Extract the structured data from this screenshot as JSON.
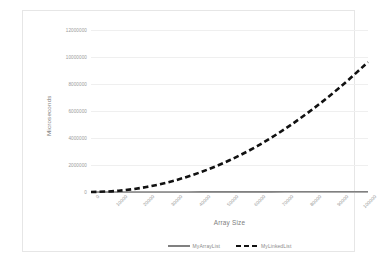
{
  "chart_data": {
    "type": "line",
    "title": "",
    "xlabel": "Array Size",
    "ylabel": "Microseconds",
    "xlim": [
      0,
      100000
    ],
    "ylim": [
      0,
      12000000
    ],
    "grid": true,
    "legend_position": "bottom",
    "categories": [
      0,
      10000,
      20000,
      30000,
      40000,
      50000,
      60000,
      70000,
      80000,
      90000,
      100000
    ],
    "xtick_labels": [
      "0",
      "10000",
      "20000",
      "30000",
      "40000",
      "50000",
      "60000",
      "70000",
      "80000",
      "90000",
      "100000"
    ],
    "ytick_labels": [
      "0",
      "2000000",
      "4000000",
      "6000000",
      "8000000",
      "10000000",
      "12000000"
    ],
    "ytick_values": [
      0,
      2000000,
      4000000,
      6000000,
      8000000,
      10000000,
      12000000
    ],
    "series": [
      {
        "name": "MyArrayList",
        "style": "solid",
        "color": "#808080",
        "values": [
          0,
          1500,
          3000,
          4500,
          7000,
          9000,
          11000,
          13500,
          16000,
          18500,
          21000
        ]
      },
      {
        "name": "MyLinkedList",
        "style": "dashed",
        "color": "#111111",
        "values": [
          0,
          90000,
          370000,
          840000,
          1500000,
          2350000,
          3400000,
          4670000,
          6130000,
          7780000,
          9620000
        ]
      }
    ]
  },
  "axes": {
    "y_title": "Microseconds",
    "x_title": "Array Size"
  },
  "legend": {
    "entries": [
      {
        "label": "MyArrayList"
      },
      {
        "label": "MyLinkedList"
      }
    ]
  }
}
